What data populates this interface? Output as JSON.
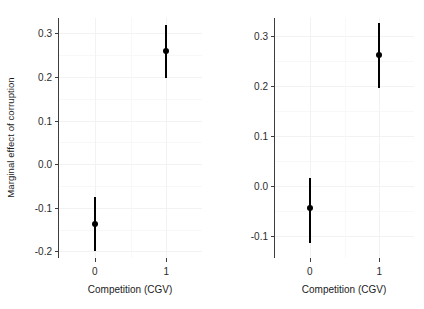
{
  "chart_data": {
    "type": "scatter",
    "title": "",
    "xlabel": "Competition (CGV)",
    "ylabel": "Marginal effect of corruption",
    "grid": true,
    "legend": "none",
    "facets": [
      {
        "name": "panel-left",
        "xlabel": "Competition (CGV)",
        "ylabel": "Marginal effect of corruption",
        "x_categories": [
          "0",
          "1"
        ],
        "yticks": [
          "0.3",
          "0.2",
          "0.1",
          "0.0",
          "-0.1",
          "-0.2"
        ],
        "ytick_values": [
          0.3,
          0.2,
          0.1,
          0.0,
          -0.1,
          -0.2
        ],
        "ylim": [
          -0.215,
          0.335
        ],
        "points": [
          {
            "x": "0",
            "estimate": -0.138,
            "ci_low": -0.198,
            "ci_high": -0.076
          },
          {
            "x": "1",
            "estimate": 0.26,
            "ci_low": 0.198,
            "ci_high": 0.318
          }
        ]
      },
      {
        "name": "panel-right",
        "xlabel": "Competition (CGV)",
        "ylabel": "",
        "x_categories": [
          "0",
          "1"
        ],
        "yticks": [
          "0.3",
          "0.2",
          "0.1",
          "0.0",
          "-0.1"
        ],
        "ytick_values": [
          0.3,
          0.2,
          0.1,
          0.0,
          -0.1
        ],
        "ylim": [
          -0.145,
          0.335
        ],
        "points": [
          {
            "x": "0",
            "estimate": -0.045,
            "ci_low": -0.115,
            "ci_high": 0.015
          },
          {
            "x": "1",
            "estimate": 0.262,
            "ci_low": 0.196,
            "ci_high": 0.326
          }
        ]
      }
    ],
    "colors": {
      "point": "#000000",
      "range": "#000000",
      "grid_major": "#f2f2f2",
      "grid_minor": "#f8f8f8",
      "axis": "#3d3d3d",
      "background": "#ffffff",
      "text": "#2b2b2b"
    }
  },
  "axis_titles": {
    "y": "Marginal effect of corruption",
    "x_left": "Competition (CGV)",
    "x_right": "Competition (CGV)"
  },
  "top_strip": {
    "text": ""
  }
}
